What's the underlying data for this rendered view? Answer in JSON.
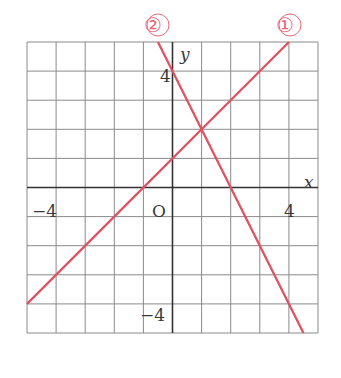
{
  "chart_data": {
    "type": "line",
    "title": "",
    "xlabel": "x",
    "ylabel": "y",
    "xlim": [
      -5,
      5
    ],
    "ylim": [
      -5,
      5
    ],
    "grid": true,
    "grid_step": 1,
    "origin_label": "O",
    "x_tick_labels": [
      {
        "value": -4,
        "label": "−4"
      },
      {
        "value": 4,
        "label": "4"
      }
    ],
    "y_tick_labels": [
      {
        "value": 4,
        "label": "4"
      },
      {
        "value": -4,
        "label": "−4"
      }
    ],
    "series": [
      {
        "name": "①",
        "equation": "y = x + 1",
        "x": [
          -5,
          4
        ],
        "y": [
          -4,
          5
        ],
        "color": "#e0505f"
      },
      {
        "name": "②",
        "equation": "y = -2x + 4",
        "x": [
          -0.5,
          4.5
        ],
        "y": [
          5,
          -5
        ],
        "color": "#e0505f"
      }
    ],
    "intersection": {
      "x": 1,
      "y": 2
    }
  },
  "labels": {
    "x_axis": "x",
    "y_axis": "y",
    "origin": "O",
    "x_neg4": "−4",
    "x_pos4": "4",
    "y_pos4": "4",
    "y_neg4": "−4",
    "line1": "①",
    "line2": "②"
  }
}
